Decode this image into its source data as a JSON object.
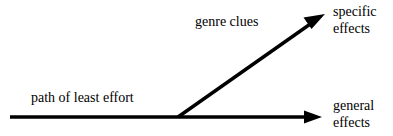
{
  "diagram": {
    "type": "branching-arrow-diagram",
    "background_color": "#ffffff",
    "stroke_color": "#000000",
    "labels": {
      "baseline_path": "path of least effort",
      "branch_path": "genre clues",
      "upper_endpoint_line1": "specific",
      "upper_endpoint_line2": "effects",
      "lower_endpoint_line1": "general",
      "lower_endpoint_line2": "effects"
    },
    "arrows": [
      {
        "name": "horizontal-arrow",
        "label": "path of least effort",
        "from": [
          10,
          117
        ],
        "to": [
          322,
          117
        ],
        "points_to": "general effects"
      },
      {
        "name": "diagonal-arrow",
        "label": "genre clues",
        "from": [
          178,
          117
        ],
        "to": [
          325,
          14
        ],
        "points_to": "specific effects"
      }
    ]
  }
}
